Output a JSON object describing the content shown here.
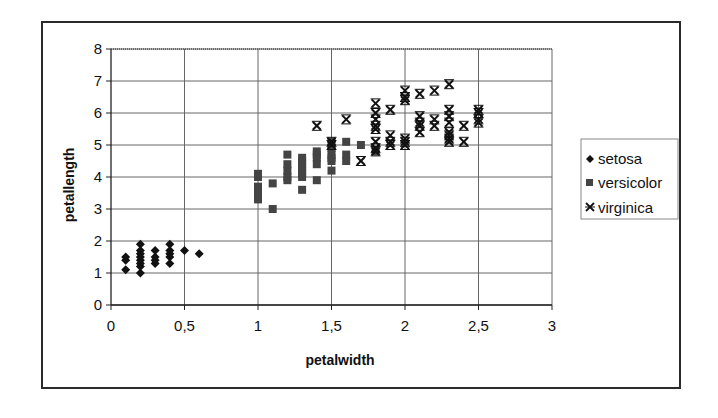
{
  "chart_data": {
    "type": "scatter",
    "title": "",
    "xlabel": "petalwidth",
    "ylabel": "petallength",
    "xlim": [
      0,
      3
    ],
    "ylim": [
      0,
      8
    ],
    "x_ticks": [
      "0",
      "0,5",
      "1",
      "1,5",
      "2",
      "2,5",
      "3"
    ],
    "x_tick_values": [
      0,
      0.5,
      1,
      1.5,
      2,
      2.5,
      3
    ],
    "y_ticks": [
      "0",
      "1",
      "2",
      "3",
      "4",
      "5",
      "6",
      "7",
      "8"
    ],
    "y_tick_values": [
      0,
      1,
      2,
      3,
      4,
      5,
      6,
      7,
      8
    ],
    "grid": true,
    "legend_position": "right",
    "series": [
      {
        "name": "setosa",
        "marker": "diamond",
        "color": "#111111",
        "points": [
          [
            0.1,
            1.1
          ],
          [
            0.1,
            1.4
          ],
          [
            0.1,
            1.5
          ],
          [
            0.2,
            1.0
          ],
          [
            0.2,
            1.2
          ],
          [
            0.2,
            1.3
          ],
          [
            0.2,
            1.4
          ],
          [
            0.2,
            1.5
          ],
          [
            0.2,
            1.6
          ],
          [
            0.2,
            1.7
          ],
          [
            0.2,
            1.9
          ],
          [
            0.3,
            1.3
          ],
          [
            0.3,
            1.4
          ],
          [
            0.3,
            1.5
          ],
          [
            0.3,
            1.7
          ],
          [
            0.4,
            1.3
          ],
          [
            0.4,
            1.5
          ],
          [
            0.4,
            1.6
          ],
          [
            0.4,
            1.7
          ],
          [
            0.4,
            1.9
          ],
          [
            0.5,
            1.7
          ],
          [
            0.6,
            1.6
          ]
        ]
      },
      {
        "name": "versicolor",
        "marker": "square",
        "color": "#444444",
        "points": [
          [
            1.0,
            3.3
          ],
          [
            1.0,
            3.5
          ],
          [
            1.0,
            3.7
          ],
          [
            1.0,
            4.0
          ],
          [
            1.0,
            4.1
          ],
          [
            1.1,
            3.0
          ],
          [
            1.1,
            3.8
          ],
          [
            1.2,
            3.9
          ],
          [
            1.2,
            4.0
          ],
          [
            1.2,
            4.2
          ],
          [
            1.2,
            4.4
          ],
          [
            1.2,
            4.7
          ],
          [
            1.3,
            3.6
          ],
          [
            1.3,
            4.0
          ],
          [
            1.3,
            4.1
          ],
          [
            1.3,
            4.2
          ],
          [
            1.3,
            4.3
          ],
          [
            1.3,
            4.4
          ],
          [
            1.3,
            4.5
          ],
          [
            1.3,
            4.6
          ],
          [
            1.4,
            3.9
          ],
          [
            1.4,
            4.4
          ],
          [
            1.4,
            4.6
          ],
          [
            1.4,
            4.7
          ],
          [
            1.4,
            4.8
          ],
          [
            1.5,
            4.2
          ],
          [
            1.5,
            4.5
          ],
          [
            1.5,
            4.6
          ],
          [
            1.5,
            4.7
          ],
          [
            1.5,
            4.9
          ],
          [
            1.5,
            5.1
          ],
          [
            1.6,
            4.5
          ],
          [
            1.6,
            4.7
          ],
          [
            1.6,
            5.1
          ],
          [
            1.7,
            5.0
          ],
          [
            1.8,
            4.8
          ]
        ]
      },
      {
        "name": "virginica",
        "marker": "asterisk",
        "color": "#111111",
        "points": [
          [
            1.4,
            5.6
          ],
          [
            1.5,
            5.0
          ],
          [
            1.5,
            5.1
          ],
          [
            1.6,
            5.8
          ],
          [
            1.7,
            4.5
          ],
          [
            1.8,
            4.8
          ],
          [
            1.8,
            4.9
          ],
          [
            1.8,
            5.1
          ],
          [
            1.8,
            5.5
          ],
          [
            1.8,
            5.6
          ],
          [
            1.8,
            5.8
          ],
          [
            1.8,
            6.0
          ],
          [
            1.8,
            6.3
          ],
          [
            1.9,
            5.0
          ],
          [
            1.9,
            5.1
          ],
          [
            1.9,
            5.3
          ],
          [
            1.9,
            6.1
          ],
          [
            2.0,
            5.0
          ],
          [
            2.0,
            5.1
          ],
          [
            2.0,
            5.2
          ],
          [
            2.0,
            6.4
          ],
          [
            2.0,
            6.5
          ],
          [
            2.0,
            6.7
          ],
          [
            2.1,
            5.4
          ],
          [
            2.1,
            5.6
          ],
          [
            2.1,
            5.7
          ],
          [
            2.1,
            5.9
          ],
          [
            2.1,
            6.6
          ],
          [
            2.2,
            5.6
          ],
          [
            2.2,
            5.8
          ],
          [
            2.2,
            6.7
          ],
          [
            2.3,
            5.1
          ],
          [
            2.3,
            5.2
          ],
          [
            2.3,
            5.3
          ],
          [
            2.3,
            5.4
          ],
          [
            2.3,
            5.7
          ],
          [
            2.3,
            5.9
          ],
          [
            2.3,
            6.1
          ],
          [
            2.3,
            6.9
          ],
          [
            2.4,
            5.1
          ],
          [
            2.4,
            5.6
          ],
          [
            2.5,
            5.7
          ],
          [
            2.5,
            5.8
          ],
          [
            2.5,
            6.0
          ],
          [
            2.5,
            6.1
          ]
        ]
      }
    ]
  },
  "legend": {
    "items": [
      {
        "label": "setosa",
        "marker": "diamond"
      },
      {
        "label": "versicolor",
        "marker": "square"
      },
      {
        "label": "virginica",
        "marker": "asterisk"
      }
    ]
  },
  "colors": {
    "gridline": "#666666",
    "frame": "#2a2a2a",
    "marker_dark": "#111111",
    "marker_square": "#444444"
  }
}
